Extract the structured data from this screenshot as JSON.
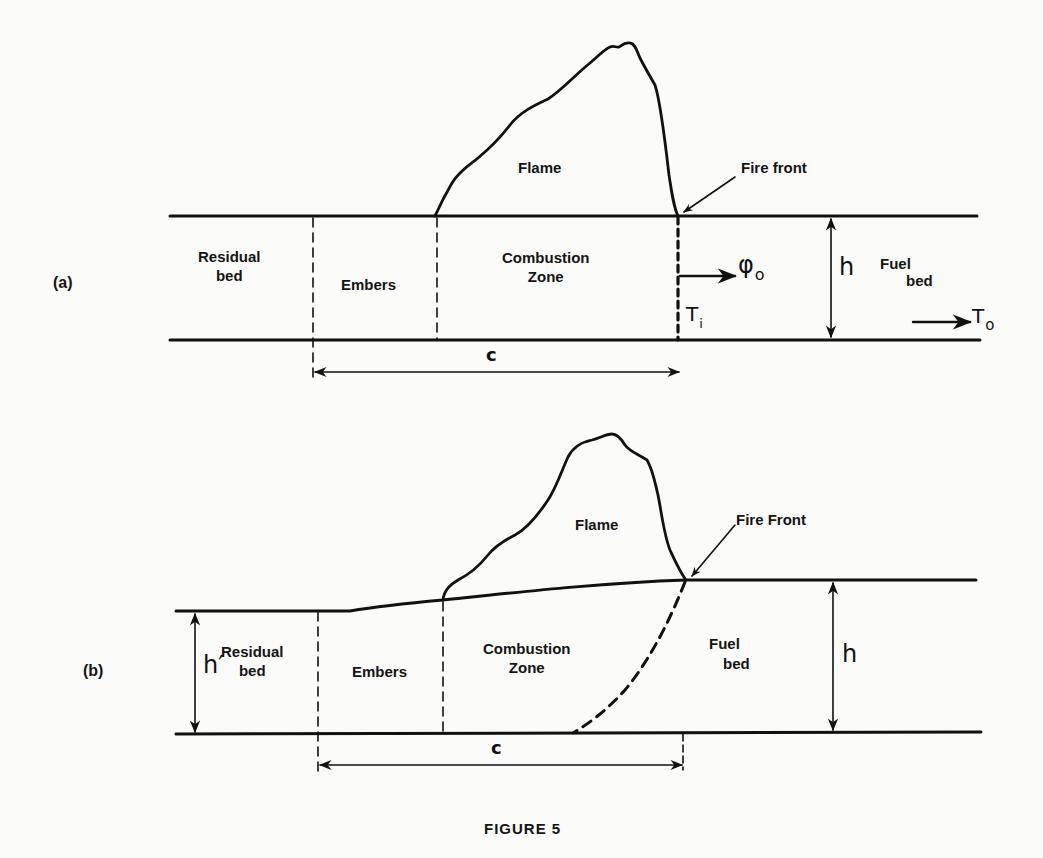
{
  "figure": {
    "caption": "FIGURE 5",
    "panels": [
      {
        "id": "a",
        "tag": "(a)",
        "labels": {
          "flame": "Flame",
          "fire_front": "Fire front",
          "residual_bed": "Residual\nbed",
          "embers": "Embers",
          "combustion_zone": "Combustion\nZone",
          "fuel_bed_1": "Fuel",
          "fuel_bed_2": "bed",
          "height": "h",
          "zone_length": "c",
          "heat_flux_symbol": "φ",
          "heat_flux_subscript": "o",
          "ignition_temp_symbol": "T",
          "ignition_temp_subscript": "i",
          "ambient_temp_symbol": "T",
          "ambient_temp_subscript": "o"
        }
      },
      {
        "id": "b",
        "tag": "(b)",
        "labels": {
          "flame": "Flame",
          "fire_front": "Fire Front",
          "residual_bed": "Residual\nbed",
          "embers": "Embers",
          "combustion_zone": "Combustion\nZone",
          "fuel_bed_1": "Fuel",
          "fuel_bed_2": "bed",
          "height": "h",
          "residual_height": "h′",
          "zone_length": "c"
        }
      }
    ],
    "stroke_color": "#111111",
    "background_color": "#fbfbf9"
  }
}
